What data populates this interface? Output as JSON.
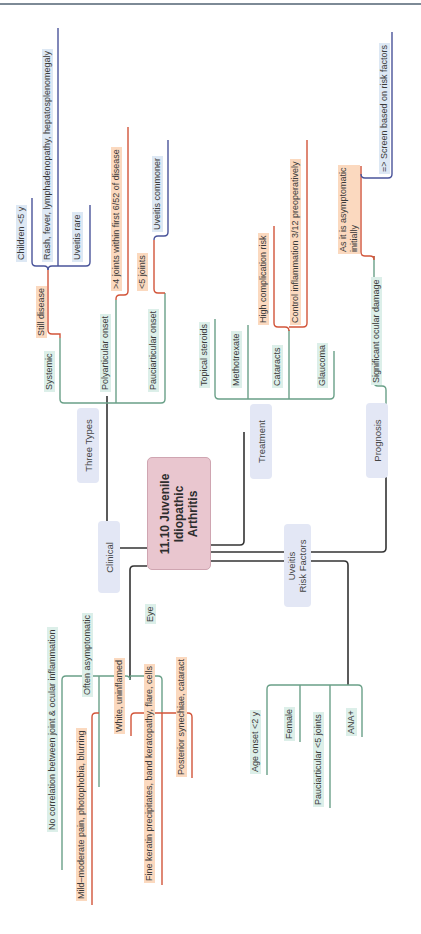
{
  "title": "11.10 Juvenile\nIdiopathic\nArthritis",
  "colors": {
    "trunk": "#333333",
    "green": "#6aa088",
    "orange": "#d2553a",
    "blue": "#4a549a",
    "center_fill": "#e9c6cf",
    "topic_fill": "#e3e7f5",
    "green_fill": "#dcefe9",
    "orange_fill": "#fbd9bf",
    "blue_fill": "#dde8f4"
  },
  "branches": {
    "three_types": {
      "label": "Three Types",
      "systemic": {
        "label": "Systemic",
        "still_disease": "Still disease",
        "children": "Children <5 y",
        "features": "Rash, fever, lymphadenopathy, hepatosplenomegaly",
        "uveitis": "Uveitis rare"
      },
      "polyarticular": {
        "label": "Polyarticular onset",
        "detail": ">4 joints within first 6/52 of disease"
      },
      "pauciarticular": {
        "label": "Pauciarticular onset",
        "detail": "<5 joints",
        "uveitis": "Uveitis commoner"
      }
    },
    "treatment": {
      "label": "Treatment",
      "items": [
        "Topical steroids",
        "Methotrexate",
        "Cataracts",
        "Glaucoma"
      ],
      "cataract_details": [
        "High complication risk",
        "Control inflammation 3/12 preoperatively"
      ]
    },
    "prognosis": {
      "label": "Prognosis",
      "damage": "Significant ocular damage",
      "reason": "As it is asymptomatic\ninitially",
      "action": "=> Screen based on risk factors"
    },
    "clinical": {
      "label": "Clinical",
      "no_correlation": "No correlation between joint & ocular inflammation",
      "often_asymptomatic": "Often asymptomatic",
      "symptoms": "Mild–moderate pain, photophobia, blurring",
      "eye": "Eye",
      "eye_details": [
        "White, uninflamed",
        "Fine keratin precipitates, band keratopathy, flare, cells",
        "Posterior synechiae, cataract"
      ]
    },
    "uveitis_risk": {
      "label": "Uveitis\nRisk Factors",
      "items": [
        "Age onset <2 y",
        "Female",
        "Pauciarticular <5 joints",
        "ANA+"
      ]
    }
  },
  "wires": [
    {
      "c": "trunk",
      "d": "M211 545 H240 Q244 545 244 541 V432"
    },
    {
      "c": "trunk",
      "d": "M147 548 H111 Q107 548 107 544 V396"
    },
    {
      "c": "trunk",
      "d": "M211 552 H382 Q386 552 386 548 V409"
    },
    {
      "c": "trunk",
      "d": "M211 561 H344 Q348 561 348 565 V685"
    },
    {
      "c": "trunk",
      "d": "M147 566 H134 Q130 566 130 570 V680"
    },
    {
      "c": "green",
      "d": "M60 392 V399 Q60 403 64 403 H161 Q165 403 165 399 V301"
    },
    {
      "c": "green",
      "d": "M116 403 V300"
    },
    {
      "c": "green",
      "d": "M60 392 V338"
    },
    {
      "c": "orange",
      "d": "M60 338 V334 H52 Q48 334 48 330 V270"
    },
    {
      "c": "blue",
      "d": "M48 270 Q48 266 52 266 H86 Q90 266 90 262 V205"
    },
    {
      "c": "blue",
      "d": "M48 270 Q48 266 44 266 H36 Q32 266 32 262 V198"
    },
    {
      "c": "blue",
      "d": "M58 266 V28"
    },
    {
      "c": "orange",
      "d": "M116 300 V299 Q116 295 120 295 H124 Q128 295 128 291 V127"
    },
    {
      "c": "green",
      "d": "M165 301 V293"
    },
    {
      "c": "orange",
      "d": "M165 293 H158 Q154 293 154 289 V240"
    },
    {
      "c": "blue",
      "d": "M154 240 Q154 236 158 236 H164 Q168 236 168 232 V140"
    },
    {
      "c": "green",
      "d": "M215 395 Q215 399 219 399 H330 Q334 399 334 395 V351"
    },
    {
      "c": "green",
      "d": "M215 395 V319"
    },
    {
      "c": "green",
      "d": "M248 399 V325"
    },
    {
      "c": "green",
      "d": "M289 399 V330"
    },
    {
      "c": "orange",
      "d": "M289 330 V331 Q289 327 285 327 H278 Q274 327 274 323 V226"
    },
    {
      "c": "orange",
      "d": "M289 327 H303 Q307 327 307 323 V140"
    },
    {
      "c": "green",
      "d": "M386 409 V390 Q386 386 382 386 H378 Q374 386 374 382 V256"
    },
    {
      "c": "orange",
      "d": "M374 256 V260 Q374 256 370 256 H365 Q361 256 361 252 V166"
    },
    {
      "c": "blue",
      "d": "M361 174 Q361 178 365 178 H388 Q392 178 392 174 V32"
    },
    {
      "c": "green",
      "d": "M130 680 Q130 676 126 676 H66 Q62 676 62 680 V870"
    },
    {
      "c": "green",
      "d": "M130 676 H158 Q162 676 162 680 V713"
    },
    {
      "c": "green",
      "d": "M99 676 V787"
    },
    {
      "c": "orange",
      "d": "M99 713 H96 Q92 713 92 717 V905"
    },
    {
      "c": "orange",
      "d": "M162 713 H135 Q131 713 131 717 V736"
    },
    {
      "c": "orange",
      "d": "M162 713 H188 Q192 713 192 717 V778"
    },
    {
      "c": "orange",
      "d": "M162 713 V885"
    },
    {
      "c": "green",
      "d": "M348 685 H271 Q267 685 267 689 V775"
    },
    {
      "c": "green",
      "d": "M348 685 H358 Q362 685 362 689 V737"
    },
    {
      "c": "green",
      "d": "M300 685 V742"
    },
    {
      "c": "green",
      "d": "M330 685 V808"
    }
  ]
}
